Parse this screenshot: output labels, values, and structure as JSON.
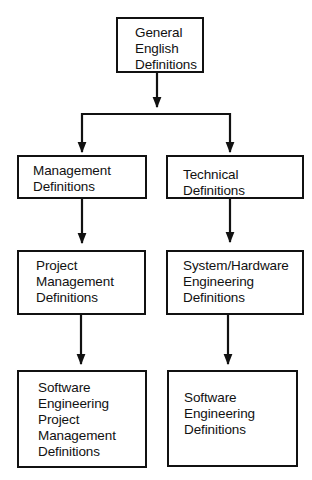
{
  "diagram": {
    "type": "hierarchy-flowchart",
    "colors": {
      "line": "#111111",
      "box_fill": "#ffffff",
      "background": "#ffffff"
    },
    "nodes": {
      "general": {
        "lines": [
          "General",
          "English",
          "Definitions"
        ]
      },
      "management": {
        "lines": [
          "Management",
          "Definitions"
        ]
      },
      "technical": {
        "lines": [
          "Technical",
          "Definitions"
        ]
      },
      "project_management": {
        "lines": [
          "Project",
          "Management",
          "Definitions"
        ]
      },
      "system_hardware": {
        "lines": [
          "System/Hardware",
          "Engineering",
          "Definitions"
        ]
      },
      "se_project_management": {
        "lines": [
          "Software",
          "Engineering",
          "Project",
          "Management",
          "Definitions"
        ]
      },
      "software_engineering": {
        "lines": [
          "Software",
          "Engineering",
          "Definitions"
        ]
      }
    },
    "edges": [
      {
        "from": "General English Definitions",
        "to": "Management Definitions"
      },
      {
        "from": "General English Definitions",
        "to": "Technical Definitions"
      },
      {
        "from": "Management Definitions",
        "to": "Project Management Definitions"
      },
      {
        "from": "Technical Definitions",
        "to": "System/Hardware Engineering Definitions"
      },
      {
        "from": "Project Management Definitions",
        "to": "Software Engineering Project Management Definitions"
      },
      {
        "from": "System/Hardware Engineering Definitions",
        "to": "Software Engineering Definitions"
      }
    ]
  }
}
